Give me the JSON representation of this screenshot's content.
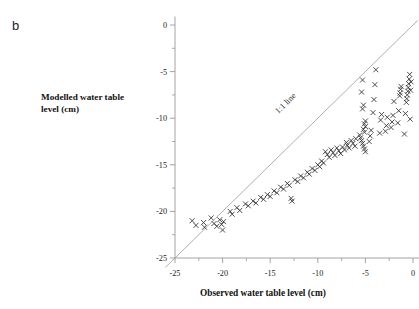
{
  "panel": {
    "label": "b"
  },
  "axes": {
    "x": {
      "title": "Observed water table level (cm)",
      "ticks": [
        -25,
        -20,
        -15,
        -10,
        -5,
        0
      ],
      "tick_labels": [
        "-25",
        "-20",
        "-15",
        "-10",
        "-5",
        "0"
      ],
      "min": -26.5,
      "max": 0.8,
      "minor_step": 2.5
    },
    "y": {
      "title_line1": "Modelled water table",
      "title_line2": "level (cm)",
      "ticks": [
        0,
        -5,
        -10,
        -15,
        -20,
        -25
      ],
      "tick_labels": [
        "0",
        "-5",
        "-10",
        "-15",
        "-20",
        "-25"
      ],
      "min": -26.0,
      "max": 0.9,
      "minor_step": 2.5
    }
  },
  "annotations": [
    {
      "name": "one-to-one-line-label",
      "text": "1:1 line",
      "x": -13.2,
      "y": -8.6,
      "rotation": -45
    }
  ],
  "colors": {
    "axis": "#8d8d8d",
    "marker": "#2f2f2f",
    "reference_line": "#9a9a9a",
    "text": "#1a1a1a",
    "background": "#ffffff"
  },
  "chart_data": {
    "type": "scatter",
    "title": "",
    "xlabel": "Observed water table level (cm)",
    "ylabel": "Modelled water table level (cm)",
    "xlim": [
      -26.5,
      0.8
    ],
    "ylim": [
      -26.0,
      0.9
    ],
    "grid": false,
    "legend": null,
    "marker": "x",
    "reference_line": {
      "label": "1:1 line",
      "slope": 1,
      "intercept": 0,
      "from": [
        -26.0,
        -26.0
      ],
      "to": [
        0.5,
        0.5
      ]
    },
    "series": [
      {
        "name": "Modelled vs observed water table level",
        "points": [
          [
            -23.2,
            -21.0
          ],
          [
            -22.8,
            -21.5
          ],
          [
            -22.0,
            -21.2
          ],
          [
            -21.9,
            -21.7
          ],
          [
            -21.2,
            -20.7
          ],
          [
            -20.9,
            -21.3
          ],
          [
            -20.6,
            -21.6
          ],
          [
            -20.3,
            -20.9
          ],
          [
            -20.1,
            -21.4
          ],
          [
            -20.0,
            -22.0
          ],
          [
            -19.9,
            -21.1
          ],
          [
            -19.2,
            -20.0
          ],
          [
            -19.0,
            -20.3
          ],
          [
            -18.5,
            -19.6
          ],
          [
            -18.2,
            -19.9
          ],
          [
            -17.6,
            -19.2
          ],
          [
            -17.3,
            -19.4
          ],
          [
            -16.8,
            -18.9
          ],
          [
            -16.5,
            -19.1
          ],
          [
            -16.0,
            -18.5
          ],
          [
            -15.7,
            -18.7
          ],
          [
            -15.3,
            -18.2
          ],
          [
            -15.0,
            -18.4
          ],
          [
            -14.6,
            -17.8
          ],
          [
            -14.3,
            -18.0
          ],
          [
            -13.9,
            -17.4
          ],
          [
            -13.6,
            -17.6
          ],
          [
            -13.2,
            -17.0
          ],
          [
            -13.0,
            -17.2
          ],
          [
            -12.8,
            -18.6
          ],
          [
            -12.7,
            -18.9
          ],
          [
            -12.4,
            -16.6
          ],
          [
            -12.1,
            -16.8
          ],
          [
            -11.8,
            -16.2
          ],
          [
            -11.5,
            -16.4
          ],
          [
            -11.1,
            -15.8
          ],
          [
            -10.9,
            -16.0
          ],
          [
            -10.6,
            -15.4
          ],
          [
            -10.3,
            -15.6
          ],
          [
            -10.0,
            -15.0
          ],
          [
            -9.8,
            -15.2
          ],
          [
            -9.6,
            -14.6
          ],
          [
            -9.4,
            -14.8
          ],
          [
            -9.2,
            -13.6
          ],
          [
            -9.0,
            -13.9
          ],
          [
            -8.8,
            -14.2
          ],
          [
            -8.6,
            -13.4
          ],
          [
            -8.4,
            -13.7
          ],
          [
            -8.2,
            -14.0
          ],
          [
            -8.0,
            -13.2
          ],
          [
            -7.8,
            -13.5
          ],
          [
            -7.6,
            -13.8
          ],
          [
            -7.4,
            -13.1
          ],
          [
            -7.2,
            -13.4
          ],
          [
            -7.0,
            -12.6
          ],
          [
            -6.9,
            -12.9
          ],
          [
            -6.7,
            -13.2
          ],
          [
            -6.5,
            -12.4
          ],
          [
            -6.3,
            -12.7
          ],
          [
            -6.1,
            -13.0
          ],
          [
            -6.0,
            -12.2
          ],
          [
            -5.6,
            -11.8
          ],
          [
            -5.5,
            -12.1
          ],
          [
            -5.4,
            -12.4
          ],
          [
            -5.3,
            -12.7
          ],
          [
            -5.2,
            -13.0
          ],
          [
            -5.1,
            -13.3
          ],
          [
            -5.0,
            -13.6
          ],
          [
            -5.0,
            -10.3
          ],
          [
            -5.1,
            -10.6
          ],
          [
            -5.0,
            -10.9
          ],
          [
            -5.2,
            -11.2
          ],
          [
            -5.1,
            -11.5
          ],
          [
            -5.3,
            -9.0
          ],
          [
            -5.2,
            -8.6
          ],
          [
            -5.4,
            -7.2
          ],
          [
            -5.3,
            -5.9
          ],
          [
            -4.6,
            -12.5
          ],
          [
            -4.5,
            -11.9
          ],
          [
            -4.4,
            -11.3
          ],
          [
            -4.2,
            -9.4
          ],
          [
            -4.1,
            -8.0
          ],
          [
            -4.0,
            -6.4
          ],
          [
            -3.9,
            -4.8
          ],
          [
            -3.5,
            -11.6
          ],
          [
            -3.4,
            -10.2
          ],
          [
            -3.3,
            -9.6
          ],
          [
            -2.9,
            -11.4
          ],
          [
            -2.8,
            -10.8
          ],
          [
            -2.7,
            -9.9
          ],
          [
            -2.3,
            -11.0
          ],
          [
            -2.2,
            -10.4
          ],
          [
            -2.1,
            -9.7
          ],
          [
            -2.0,
            -8.2
          ],
          [
            -1.6,
            -10.5
          ],
          [
            -1.5,
            -9.2
          ],
          [
            -1.4,
            -7.6
          ],
          [
            -1.35,
            -7.3
          ],
          [
            -1.3,
            -6.9
          ],
          [
            -1.25,
            -6.6
          ],
          [
            -0.9,
            -11.7
          ],
          [
            -0.8,
            -9.5
          ],
          [
            -0.7,
            -8.3
          ],
          [
            -0.65,
            -7.9
          ],
          [
            -0.6,
            -7.5
          ],
          [
            -0.55,
            -7.1
          ],
          [
            -0.5,
            -6.7
          ],
          [
            -0.45,
            -6.3
          ],
          [
            -0.4,
            -5.8
          ],
          [
            -0.35,
            -5.3
          ],
          [
            -0.3,
            -10.1
          ],
          [
            -0.25,
            -7.0
          ],
          [
            -0.2,
            -6.1
          ]
        ]
      }
    ]
  }
}
